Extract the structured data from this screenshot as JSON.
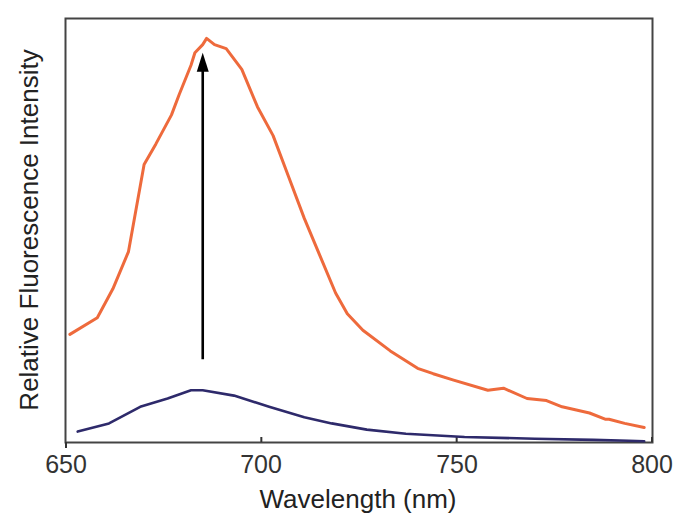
{
  "chart_data": {
    "type": "line",
    "title": "",
    "xlabel": "Wavelength (nm)",
    "ylabel": "Relative Fluorescence Intensity",
    "xlim": [
      650,
      800
    ],
    "ylim": [
      0,
      1
    ],
    "x_ticks": [
      650,
      700,
      750,
      800
    ],
    "y_ticks": [],
    "grid": false,
    "legend": null,
    "series": [
      {
        "name": "after (high intensity)",
        "color": "#EE6A3C",
        "x": [
          651,
          658,
          662,
          666,
          670,
          673,
          677,
          679,
          682,
          683,
          685,
          686,
          688,
          691,
          695,
          699,
          703,
          707,
          711,
          715,
          719,
          722,
          726,
          733,
          740,
          744,
          749,
          758,
          762,
          768,
          773,
          777,
          784,
          788,
          789,
          793,
          798
        ],
        "y": [
          0.26,
          0.3,
          0.37,
          0.46,
          0.67,
          0.72,
          0.79,
          0.84,
          0.91,
          0.94,
          0.96,
          0.975,
          0.96,
          0.95,
          0.9,
          0.81,
          0.74,
          0.64,
          0.54,
          0.45,
          0.36,
          0.31,
          0.27,
          0.22,
          0.178,
          0.165,
          0.15,
          0.125,
          0.13,
          0.105,
          0.1,
          0.085,
          0.07,
          0.055,
          0.055,
          0.045,
          0.035
        ]
      },
      {
        "name": "before (low intensity)",
        "color": "#2E2A6B",
        "x": [
          653,
          661,
          669,
          676,
          682,
          685,
          693,
          702,
          711,
          718,
          727,
          737,
          752,
          770,
          785,
          794,
          798
        ],
        "y": [
          0.025,
          0.045,
          0.085,
          0.105,
          0.125,
          0.125,
          0.112,
          0.085,
          0.06,
          0.045,
          0.03,
          0.02,
          0.012,
          0.008,
          0.005,
          0.003,
          0.002
        ]
      }
    ],
    "annotations": [
      {
        "type": "arrow",
        "x": 685,
        "y_from": 0.2,
        "y_to": 0.94,
        "color": "#000000",
        "text": ""
      }
    ]
  },
  "x_axis": {
    "title": "Wavelength (nm)",
    "ticks": [
      "650",
      "700",
      "750",
      "800"
    ]
  },
  "y_axis": {
    "title": "Relative Fluorescence Intensity"
  }
}
